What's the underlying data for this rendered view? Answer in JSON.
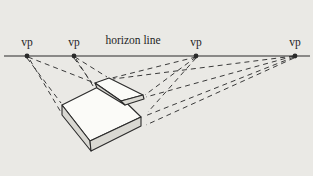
{
  "diagram": {
    "type": "perspective-construction-figure",
    "title_label": "horizon line",
    "vanishing_points": [
      {
        "label": "vp",
        "x": 27,
        "y": 56
      },
      {
        "label": "vp",
        "x": 74,
        "y": 56
      },
      {
        "label": "vp",
        "x": 196,
        "y": 56
      },
      {
        "label": "vp",
        "x": 295,
        "y": 56
      }
    ],
    "objects": [
      "bottom-slab",
      "top-slab"
    ],
    "colors": {
      "background": "#eae9e5",
      "line": "#2a2a2a",
      "dash": "#3a3a3a",
      "face_top": "#fbfbf8",
      "face_side": "#d9d8d2",
      "text": "#1f1f1f"
    }
  }
}
